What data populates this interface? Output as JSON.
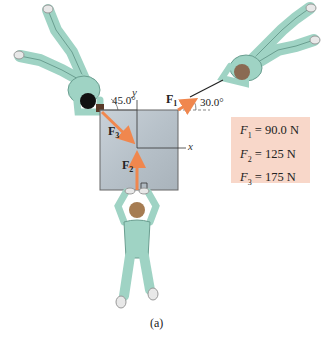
{
  "diagram": {
    "caption": "(a)",
    "axes": {
      "x_label": "x",
      "y_label": "y"
    },
    "forces": [
      {
        "name": "F1",
        "label": "F",
        "subscript": "1",
        "magnitude": "90.0 N",
        "angle_label": "30.0°",
        "reference": "above +x axis"
      },
      {
        "name": "F2",
        "label": "F",
        "subscript": "2",
        "magnitude": "125 N",
        "angle_label": "",
        "reference": "along +y axis"
      },
      {
        "name": "F3",
        "label": "F",
        "subscript": "3",
        "magnitude": "175 N",
        "angle_label": "45.0°",
        "reference": "from horizontal, upper-left"
      }
    ],
    "given_box": {
      "lines": [
        {
          "sym": "F",
          "sub": "1",
          "eq": " = 90.0 N"
        },
        {
          "sym": "F",
          "sub": "2",
          "eq": " = 125 N"
        },
        {
          "sym": "F",
          "sub": "3",
          "eq": " = 175 N"
        }
      ]
    },
    "colors": {
      "crate": "#b9c3cb",
      "arrow": "#f0874e",
      "suit": "#9fd3c4",
      "suit_shadow": "#6a9e90",
      "given_box_bg": "#f8d7c9"
    }
  }
}
